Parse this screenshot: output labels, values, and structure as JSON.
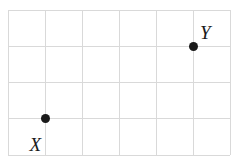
{
  "figure": {
    "background_color": "#ffffff",
    "grid": {
      "line_color": "#d9d9d9",
      "columns": 6,
      "rows": 4,
      "left": 8,
      "top": 10,
      "width": 222,
      "height": 145,
      "x_positions": [
        8,
        45,
        82,
        119,
        156,
        193,
        230
      ],
      "y_positions": [
        10,
        46,
        82,
        118,
        155
      ]
    },
    "points": [
      {
        "name": "X",
        "label": "X",
        "dot_color": "#1a1a1a",
        "x": 45,
        "y": 118,
        "grid_col": 1,
        "grid_row": 3,
        "label_offset_x": -4,
        "label_offset_y": 17,
        "label_placement": "below-left"
      },
      {
        "name": "Y",
        "label": "Y",
        "dot_color": "#1a1a1a",
        "x": 193,
        "y": 46,
        "grid_col": 5,
        "grid_row": 1,
        "label_offset_x": 7,
        "label_offset_y": -4,
        "label_placement": "above-right"
      }
    ]
  }
}
